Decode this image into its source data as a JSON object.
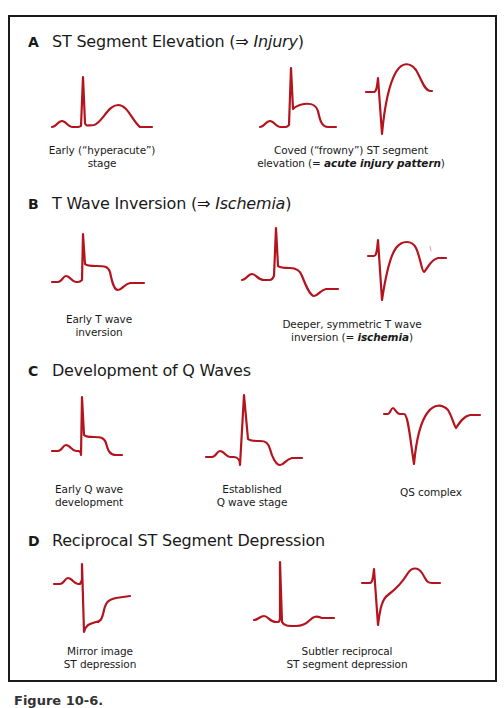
{
  "figure": {
    "stroke_color": "#b3141e",
    "border_color": "#1a1a1a",
    "caption": "Figure 10-6."
  },
  "sections": [
    {
      "letter": "A",
      "title_plain": "ST Segment Elevation (⇒ ",
      "title_italic": "Injury",
      "title_close": ")",
      "labels": [
        {
          "line1": "Early (“hyperacute”)",
          "line2": "stage"
        },
        {
          "line1": "Coved (“frowny”) ST segment",
          "line2_plain": "elevation (= ",
          "line2_emph": "acute injury pattern",
          "line2_close": ")"
        }
      ]
    },
    {
      "letter": "B",
      "title_plain": "T Wave Inversion (⇒ ",
      "title_italic": "Ischemia",
      "title_close": ")",
      "labels": [
        {
          "line1": "Early T wave",
          "line2": "inversion"
        },
        {
          "line1": "Deeper, symmetric T wave",
          "line2_plain": "inversion (= ",
          "line2_emph": "ischemia",
          "line2_close": ")"
        }
      ]
    },
    {
      "letter": "C",
      "title_plain": "Development of Q Waves",
      "labels": [
        {
          "line1": "Early Q wave",
          "line2": "development"
        },
        {
          "line1": "Established",
          "line2": "Q wave stage"
        },
        {
          "line1": "QS complex"
        }
      ]
    },
    {
      "letter": "D",
      "title_plain": "Reciprocal ST Segment Depression",
      "labels": [
        {
          "line1": "Mirror image",
          "line2": "ST depression"
        },
        {
          "line1": "Subtler reciprocal",
          "line2": "ST segment depression"
        }
      ]
    }
  ]
}
